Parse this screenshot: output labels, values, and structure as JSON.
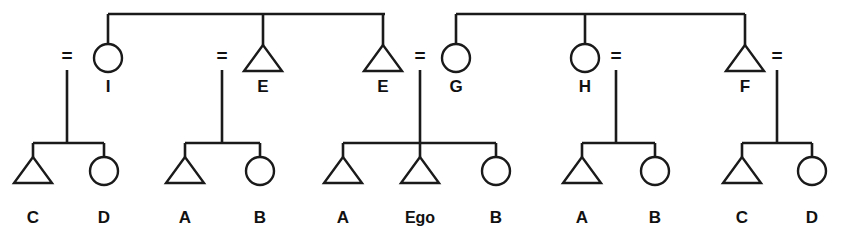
{
  "diagram": {
    "type": "kinship-genealogy",
    "background_color": "#ffffff",
    "line_color": "#1a1a1a",
    "text_color": "#111111",
    "symbols": {
      "triangle": "male",
      "circle": "female",
      "equals": "marriage-union"
    },
    "ego_label": "Ego"
  },
  "top_sibling_bars": [
    {
      "id": "bar-left",
      "x1": 108,
      "x2": 385,
      "y": 14
    },
    {
      "id": "bar-right",
      "x1": 456,
      "x2": 745,
      "y": 14
    }
  ],
  "parents": [
    {
      "id": "p1",
      "label": "I",
      "shape": "circle",
      "cx": 108,
      "cy": 58,
      "eq_x": 67,
      "eq_y": 62,
      "descent_x": 67,
      "sib_from_bar": "bar-left"
    },
    {
      "id": "p2",
      "label": "E",
      "shape": "triangle",
      "cx": 263,
      "cy": 58,
      "eq_x": 222,
      "eq_y": 62,
      "descent_x": 222,
      "sib_from_bar": "bar-left"
    },
    {
      "id": "p3",
      "label": "E",
      "shape": "triangle",
      "cx": 383,
      "cy": 58,
      "eq_x": 420,
      "eq_y": 62,
      "descent_x": 420,
      "sib_from_bar": "bar-left"
    },
    {
      "id": "p4",
      "label": "G",
      "shape": "circle",
      "cx": 456,
      "cy": 58,
      "eq_x": 420,
      "eq_y": 62,
      "descent_x": 420,
      "sib_from_bar": "bar-right"
    },
    {
      "id": "p5",
      "label": "H",
      "shape": "circle",
      "cx": 585,
      "cy": 58,
      "eq_x": 616,
      "eq_y": 62,
      "descent_x": 616,
      "sib_from_bar": "bar-right"
    },
    {
      "id": "p6",
      "label": "F",
      "shape": "triangle",
      "cx": 745,
      "cy": 58,
      "eq_x": 777,
      "eq_y": 62,
      "descent_x": 777,
      "sib_from_bar": "bar-right"
    }
  ],
  "families": [
    {
      "id": "family-1",
      "descent_x": 67,
      "bar_y": 143,
      "children": [
        {
          "id": "c1",
          "label": "C",
          "shape": "triangle",
          "cx": 33
        },
        {
          "id": "c2",
          "label": "D",
          "shape": "circle",
          "cx": 104
        }
      ]
    },
    {
      "id": "family-2",
      "descent_x": 222,
      "bar_y": 143,
      "children": [
        {
          "id": "c3",
          "label": "A",
          "shape": "triangle",
          "cx": 185
        },
        {
          "id": "c4",
          "label": "B",
          "shape": "circle",
          "cx": 260
        }
      ]
    },
    {
      "id": "family-3",
      "descent_x": 420,
      "bar_y": 143,
      "children": [
        {
          "id": "c5",
          "label": "A",
          "shape": "triangle",
          "cx": 343
        },
        {
          "id": "c6",
          "label": "Ego",
          "shape": "triangle",
          "cx": 420,
          "is_ego": true
        },
        {
          "id": "c7",
          "label": "B",
          "shape": "circle",
          "cx": 496
        }
      ]
    },
    {
      "id": "family-4",
      "descent_x": 616,
      "bar_y": 143,
      "children": [
        {
          "id": "c8",
          "label": "A",
          "shape": "triangle",
          "cx": 582
        },
        {
          "id": "c9",
          "label": "B",
          "shape": "circle",
          "cx": 655
        }
      ]
    },
    {
      "id": "family-5",
      "descent_x": 777,
      "bar_y": 143,
      "children": [
        {
          "id": "c10",
          "label": "C",
          "shape": "triangle",
          "cx": 742
        },
        {
          "id": "c11",
          "label": "D",
          "shape": "circle",
          "cx": 812
        }
      ]
    }
  ],
  "geometry": {
    "circle_r": 14,
    "tri_half_w": 19,
    "tri_h": 26,
    "parent_label_y": 92,
    "child_label_y": 223,
    "child_symbol_top": 157,
    "descent_top": 70,
    "descent_bottom": 143
  }
}
